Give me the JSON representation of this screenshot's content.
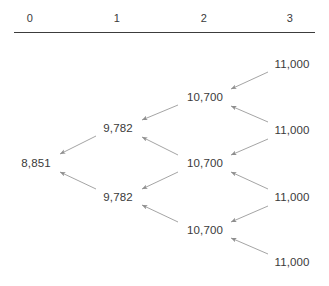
{
  "diagram": {
    "type": "binomial-tree",
    "title": "",
    "line_color": "#9a9a9a",
    "text_color": "#3a3a3a",
    "rule_color": "#3c3c3c",
    "background": "#ffffff",
    "columns": [
      {
        "label": "0",
        "x": 30
      },
      {
        "label": "1",
        "x": 117
      },
      {
        "label": "2",
        "x": 204
      },
      {
        "label": "3",
        "x": 290
      }
    ],
    "nodes": [
      {
        "id": "n0",
        "label": "8,851",
        "step": 0,
        "x": 36,
        "y": 163
      },
      {
        "id": "n1u",
        "label": "9,782",
        "step": 1,
        "x": 118,
        "y": 128
      },
      {
        "id": "n1d",
        "label": "9,782",
        "step": 1,
        "x": 118,
        "y": 197
      },
      {
        "id": "n2u",
        "label": "10,700",
        "step": 2,
        "x": 205,
        "y": 97
      },
      {
        "id": "n2m",
        "label": "10,700",
        "step": 2,
        "x": 205,
        "y": 163
      },
      {
        "id": "n2d",
        "label": "10,700",
        "step": 2,
        "x": 205,
        "y": 230
      },
      {
        "id": "n3a",
        "label": "11,000",
        "step": 3,
        "x": 292,
        "y": 64
      },
      {
        "id": "n3b",
        "label": "11,000",
        "step": 3,
        "x": 292,
        "y": 130
      },
      {
        "id": "n3c",
        "label": "11,000",
        "step": 3,
        "x": 292,
        "y": 197
      },
      {
        "id": "n3d",
        "label": "11,000",
        "step": 3,
        "x": 292,
        "y": 262
      }
    ],
    "edges": [
      {
        "from": "n1u",
        "to": "n0",
        "x1": 96,
        "y1": 136,
        "x2": 60,
        "y2": 154
      },
      {
        "from": "n1d",
        "to": "n0",
        "x1": 96,
        "y1": 189,
        "x2": 60,
        "y2": 172
      },
      {
        "from": "n2u",
        "to": "n1u",
        "x1": 178,
        "y1": 105,
        "x2": 142,
        "y2": 120
      },
      {
        "from": "n2m",
        "to": "n1u",
        "x1": 178,
        "y1": 155,
        "x2": 142,
        "y2": 137
      },
      {
        "from": "n2m",
        "to": "n1d",
        "x1": 178,
        "y1": 172,
        "x2": 142,
        "y2": 189
      },
      {
        "from": "n2d",
        "to": "n1d",
        "x1": 178,
        "y1": 222,
        "x2": 142,
        "y2": 205
      },
      {
        "from": "n3a",
        "to": "n2u",
        "x1": 268,
        "y1": 72,
        "x2": 231,
        "y2": 89
      },
      {
        "from": "n3b",
        "to": "n2u",
        "x1": 268,
        "y1": 122,
        "x2": 231,
        "y2": 106
      },
      {
        "from": "n3b",
        "to": "n2m",
        "x1": 268,
        "y1": 139,
        "x2": 231,
        "y2": 155
      },
      {
        "from": "n3c",
        "to": "n2m",
        "x1": 268,
        "y1": 189,
        "x2": 231,
        "y2": 172
      },
      {
        "from": "n3c",
        "to": "n2d",
        "x1": 268,
        "y1": 206,
        "x2": 231,
        "y2": 222
      },
      {
        "from": "n3d",
        "to": "n2d",
        "x1": 268,
        "y1": 254,
        "x2": 231,
        "y2": 238
      }
    ]
  }
}
